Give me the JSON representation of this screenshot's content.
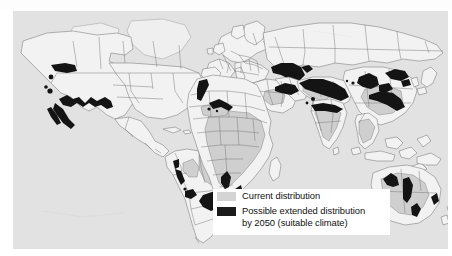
{
  "figure": {
    "type": "thematic-world-map"
  },
  "map": {
    "background_color": "#e2e2e2",
    "land_fill_color": "#f2f2f2",
    "outline_color": "#6e6e6e",
    "current_distribution_color": "#cfcfcf",
    "extended_distribution_color": "#141414"
  },
  "legend": {
    "background_color": "#ffffff",
    "items": [
      {
        "swatch_color": "#d4d4d4",
        "swatch_name": "current-distribution-swatch",
        "label": "Current distribution"
      },
      {
        "swatch_color": "#1b1b1b",
        "swatch_name": "extended-distribution-swatch",
        "label": "Possible extended distribution",
        "label_line2": "by 2050 (suitable climate)"
      }
    ]
  }
}
